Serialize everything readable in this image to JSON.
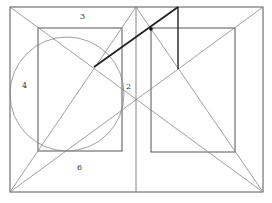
{
  "diagram": {
    "labels": [
      {
        "id": "label-3",
        "text": "3",
        "x": 80,
        "y": 19
      },
      {
        "id": "label-4",
        "text": "4",
        "x": 24,
        "y": 88
      },
      {
        "id": "label-2",
        "text": "2",
        "x": 129,
        "y": 89
      },
      {
        "id": "label-6",
        "text": "6",
        "x": 79,
        "y": 170
      }
    ],
    "colors": {
      "thin": "#888888",
      "frame": "#555555",
      "thick": "#222222"
    }
  }
}
